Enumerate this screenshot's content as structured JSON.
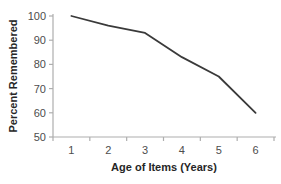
{
  "chart_data": {
    "type": "line",
    "title": "",
    "categories": [
      1,
      2,
      3,
      4,
      5,
      6
    ],
    "series": [
      {
        "name": "Percent Remembered",
        "values": [
          100,
          96,
          93,
          83,
          75,
          60
        ]
      }
    ],
    "xlabel": "Age of Items (Years)",
    "ylabel": "Percent Remembered",
    "ylim": [
      50,
      100
    ],
    "y_ticks": [
      100,
      90,
      80,
      70,
      60,
      50
    ],
    "x_ticks": [
      1,
      2,
      3,
      4,
      5,
      6
    ],
    "grid": false,
    "legend": "none",
    "colors": {
      "line": "#3a3a3a",
      "axis": "#aeaeae",
      "tick_label": "#4d4d4d",
      "axis_title": "#262626",
      "background": "#ffffff"
    }
  }
}
